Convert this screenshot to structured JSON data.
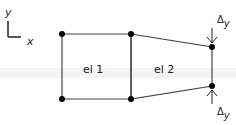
{
  "axes": {
    "y_label": "y",
    "x_label": "x"
  },
  "elements": [
    {
      "label": "el 1"
    },
    {
      "label": "el 2"
    }
  ],
  "loads": {
    "top_label_base": "Δ",
    "top_label_sub": "y",
    "bottom_label_base": "Δ",
    "bottom_label_sub": "y"
  },
  "colors": {
    "stroke": "#222222",
    "node": "#000000",
    "faint_band": "#f0f0f0"
  }
}
